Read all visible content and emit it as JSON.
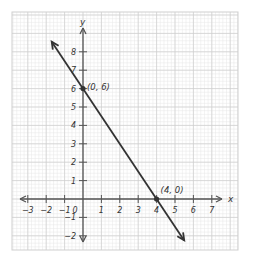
{
  "chart_data": {
    "type": "line",
    "title": "",
    "xlabel": "x",
    "ylabel": "y",
    "xlim": [
      -3.5,
      7.5
    ],
    "ylim": [
      -2.5,
      8.5
    ],
    "grid": true,
    "x_ticks": [
      -3,
      -2,
      -1,
      1,
      2,
      3,
      4,
      5,
      6,
      7
    ],
    "y_ticks": [
      -2,
      -1,
      1,
      2,
      3,
      4,
      5,
      6,
      7,
      8
    ],
    "origin_label": "0",
    "x_tick_labels": [
      "−3",
      "−2",
      "−1",
      "1",
      "2",
      "3",
      "4",
      "5",
      "6",
      "7"
    ],
    "y_tick_labels": [
      "−2",
      "−1",
      "1",
      "2",
      "3",
      "4",
      "5",
      "6",
      "7",
      "8"
    ],
    "series": [
      {
        "name": "line",
        "equation": "y = -1.5x + 6",
        "x": [
          -1.7,
          5.5
        ],
        "y": [
          8.55,
          -2.25
        ],
        "arrows": "both",
        "color": "#333333"
      }
    ],
    "points": [
      {
        "x": 0,
        "y": 6,
        "label": "(0, 6)"
      },
      {
        "x": 4,
        "y": 0,
        "label": "(4, 0)"
      }
    ]
  },
  "colors": {
    "minor_grid": "#e6e6e6",
    "major_grid": "#cfcfcf",
    "axis": "#555555",
    "line": "#333333"
  }
}
